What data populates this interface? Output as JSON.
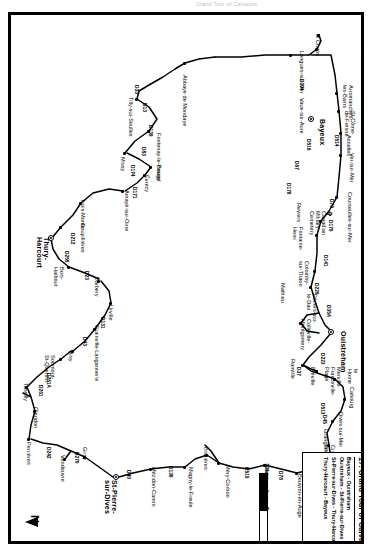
{
  "header": {
    "faint_text": "Grand Tour of Calvados"
  },
  "copyright": {
    "mark": "© IGN/CRT"
  },
  "legend": {
    "title": "17. Grand Tour of Calvados",
    "stages": [
      "Bayeux - Ouistreham",
      "Ouistreham - St-Pierre-sur-Dives",
      "St-Pierre-sur-Dives - Thury-Harcourt",
      "Thury-Harcourt - Bayeux"
    ]
  },
  "scale": {
    "ticks": [
      "0",
      "5",
      "10km"
    ],
    "unit": "km"
  },
  "compass": {
    "label": "N"
  },
  "chart_data": {
    "type": "map",
    "title": "17. Grand Tour of Calvados",
    "region": "Calvados, Normandy, France",
    "orientation": "north-to-left (page rotated 90°)",
    "major_towns": [
      "Bayeux",
      "Ouistreham",
      "St-Pierre-sur-Dives",
      "Thury-Harcourt"
    ],
    "places": [
      "le Chaos",
      "Longues-sur-Mer",
      "Vaux-sur-Aure",
      "Bayeux",
      "Arromanches-les-Bains",
      "St-Côme-de-Fresné",
      "Asnelles",
      "Ver-sur-Mer",
      "Courseulles-sur-Mer",
      "Canadian Military Cemetery",
      "Reviers",
      "Fontaine-Henri",
      "Colomby-sur-Thaon",
      "Périers-sur-le-Dan",
      "Mathieu",
      "Colleville-Montgomery",
      "Ouistreham",
      "Ranville",
      "Bréville",
      "Merville-Franceville-Plage",
      "Cabourg",
      "le Home",
      "Dives-sur-Mer",
      "Grangues",
      "Cricqueville-en-Auge",
      "Putot-en-Auge",
      "Beuvron-en-Auge",
      "Hotot-en-Auge",
      "Méry-Corbon",
      "Bissières",
      "Magny-le-Freule",
      "Mézidon-Canon",
      "St-Pierre-sur-Dives",
      "Grisy",
      "Vendeuvre",
      "Perrières",
      "Olendon",
      "Tassilly",
      "Soumont-St-Quentin",
      "Aisy",
      "Grainville-Langannerie",
      "Urville",
      "Barbery",
      "Bois-Halbout",
      "Thury-Harcourt",
      "Goupillières",
      "Trois-Monts",
      "Amayé-sur-Orne",
      "Évrecy",
      "Bougy",
      "Missy",
      "Fontenay-le-Pesnel",
      "Tilly-sur-Seulles",
      "Abbaye de Mondaye"
    ],
    "roads": [
      "D104",
      "D516",
      "D67",
      "D178",
      "D514",
      "D79",
      "D170",
      "D141",
      "D220",
      "D35A",
      "D223",
      "D37",
      "D27",
      "D513",
      "D45",
      "D49",
      "D78",
      "D510",
      "D138",
      "D40",
      "D270",
      "D242",
      "D261",
      "D261A",
      "D131",
      "D43",
      "D23",
      "D255",
      "D212",
      "D171",
      "D174",
      "D83",
      "D139",
      "D13",
      "D33"
    ]
  },
  "map": {
    "labels": [
      {
        "t": "le Chaos",
        "x": 19,
        "y": 41,
        "c": "lbl"
      },
      {
        "t": "Longues-sur-Mer",
        "x": 36,
        "y": 57,
        "c": "lbl"
      },
      {
        "t": "Vaux-sur-Aure",
        "x": 83,
        "y": 57,
        "c": "lbl"
      },
      {
        "t": "Bayeux",
        "x": 104,
        "y": 36,
        "c": "lbl big"
      },
      {
        "t": "Arromanches-\nles-Bains",
        "x": 70,
        "y": 8,
        "c": "lbl"
      },
      {
        "t": "St-Côme-\nde-Fresné",
        "x": 96,
        "y": 6,
        "c": "lbl"
      },
      {
        "t": "Asnelles",
        "x": 120,
        "y": 10,
        "c": "lbl"
      },
      {
        "t": "Ver-sur-Mer",
        "x": 138,
        "y": 7,
        "c": "lbl"
      },
      {
        "t": "Courseulles-sur-Mer",
        "x": 177,
        "y": 9,
        "c": "lbl"
      },
      {
        "t": "Canadian\nMilitary\nCemetery",
        "x": 196,
        "y": 35,
        "c": "lbl"
      },
      {
        "t": "Reviers",
        "x": 188,
        "y": 60,
        "c": "lbl"
      },
      {
        "t": "Fontaine-\nHenri",
        "x": 212,
        "y": 58,
        "c": "lbl"
      },
      {
        "t": "Colomby-\nsur-Thaon",
        "x": 246,
        "y": 52,
        "c": "lbl"
      },
      {
        "t": "Périers-sur-\nle-Dan",
        "x": 279,
        "y": 44,
        "c": "lbl"
      },
      {
        "t": "Mathieu",
        "x": 268,
        "y": 76,
        "c": "lbl"
      },
      {
        "t": "Colleville-\nMontgomery",
        "x": 304,
        "y": 50,
        "c": "lbl"
      },
      {
        "t": "Ouistreham",
        "x": 316,
        "y": 15,
        "c": "lbl big"
      },
      {
        "t": "Ranville",
        "x": 344,
        "y": 66,
        "c": "lbl"
      },
      {
        "t": "Bréville",
        "x": 352,
        "y": 46,
        "c": "lbl"
      },
      {
        "t": "Merville-\nFranceville-\nPlage",
        "x": 352,
        "y": 20,
        "c": "lbl"
      },
      {
        "t": "Cabourg",
        "x": 372,
        "y": 7,
        "c": "lbl"
      },
      {
        "t": "le\nHome",
        "x": 354,
        "y": 3,
        "c": "lbl"
      },
      {
        "t": "Dives-sur-Mer",
        "x": 397,
        "y": 18,
        "c": "lbl"
      },
      {
        "t": "Grangues",
        "x": 414,
        "y": 33,
        "c": "lbl"
      },
      {
        "t": "Cricqueville-\nen-Auge",
        "x": 430,
        "y": 26,
        "c": "lbl"
      },
      {
        "t": "Putot-en-Auge",
        "x": 452,
        "y": 25,
        "c": "lbl"
      },
      {
        "t": "Beuvron-en-Auge",
        "x": 459,
        "y": 59,
        "c": "lbl"
      },
      {
        "t": "Hotot-en-Auge",
        "x": 451,
        "y": 92,
        "c": "lbl"
      },
      {
        "t": "Méry-Corbon",
        "x": 450,
        "y": 131,
        "c": "lbl"
      },
      {
        "t": "Bissières",
        "x": 432,
        "y": 153,
        "c": "lbl"
      },
      {
        "t": "Magny-le-Freule",
        "x": 452,
        "y": 168,
        "c": "lbl"
      },
      {
        "t": "Mézidon-Canon",
        "x": 452,
        "y": 205,
        "c": "lbl"
      },
      {
        "t": "St-Pierre-\nsur-Dives",
        "x": 465,
        "y": 244,
        "c": "lbl big"
      },
      {
        "t": "Grisy",
        "x": 432,
        "y": 274,
        "c": "lbl"
      },
      {
        "t": "Vendeuvre",
        "x": 440,
        "y": 296,
        "c": "lbl"
      },
      {
        "t": "Perrières",
        "x": 427,
        "y": 330,
        "c": "lbl"
      },
      {
        "t": "Olendon",
        "x": 392,
        "y": 323,
        "c": "lbl"
      },
      {
        "t": "Tassilly",
        "x": 368,
        "y": 333,
        "c": "lbl"
      },
      {
        "t": "Soumont-\nSt-Quentin",
        "x": 340,
        "y": 306,
        "c": "lbl"
      },
      {
        "t": "Aisy",
        "x": 336,
        "y": 288,
        "c": "lbl"
      },
      {
        "t": "Grainville-Langannerie",
        "x": 310,
        "y": 262,
        "c": "lbl"
      },
      {
        "t": "Urville",
        "x": 290,
        "y": 248,
        "c": "lbl"
      },
      {
        "t": "Barbery",
        "x": 262,
        "y": 262,
        "c": "lbl"
      },
      {
        "t": "Bois-\nHalbout",
        "x": 252,
        "y": 297,
        "c": "lbl"
      },
      {
        "t": "Thury-\nHarcourt",
        "x": 222,
        "y": 312,
        "c": "lbl big"
      },
      {
        "t": "Goupillières",
        "x": 208,
        "y": 276,
        "c": "lbl"
      },
      {
        "t": "Trois-Monts",
        "x": 184,
        "y": 276,
        "c": "lbl"
      },
      {
        "t": "Amayé-sur-Orne",
        "x": 175,
        "y": 232,
        "c": "lbl"
      },
      {
        "t": "Évrecy",
        "x": 160,
        "y": 212,
        "c": "lbl"
      },
      {
        "t": "Bougy",
        "x": 150,
        "y": 200,
        "c": "lbl"
      },
      {
        "t": "Missy",
        "x": 142,
        "y": 236,
        "c": "lbl"
      },
      {
        "t": "Fontenay-le-Pesnel",
        "x": 118,
        "y": 200,
        "c": "lbl"
      },
      {
        "t": "Tilly-sur-Seulles",
        "x": 82,
        "y": 228,
        "c": "lbl"
      },
      {
        "t": "Abbaye de Mondaye",
        "x": 60,
        "y": 174,
        "c": "lbl"
      }
    ],
    "roads": [
      {
        "t": "D104",
        "x": 64,
        "y": 57
      },
      {
        "t": "D516",
        "x": 124,
        "y": 50
      },
      {
        "t": "D67",
        "x": 146,
        "y": 62
      },
      {
        "t": "D178",
        "x": 168,
        "y": 70
      },
      {
        "t": "D514",
        "x": 120,
        "y": 22
      },
      {
        "t": "D79",
        "x": 184,
        "y": 27
      },
      {
        "t": "D170",
        "x": 205,
        "y": 28
      },
      {
        "t": "D141",
        "x": 240,
        "y": 33
      },
      {
        "t": "D220",
        "x": 268,
        "y": 42
      },
      {
        "t": "D35A",
        "x": 290,
        "y": 30
      },
      {
        "t": "D223",
        "x": 338,
        "y": 36
      },
      {
        "t": "D37",
        "x": 352,
        "y": 60
      },
      {
        "t": "D513",
        "x": 388,
        "y": 36
      },
      {
        "t": "D45",
        "x": 400,
        "y": 34
      },
      {
        "t": "D49",
        "x": 447,
        "y": 44
      },
      {
        "t": "D78",
        "x": 456,
        "y": 78
      },
      {
        "t": "D510",
        "x": 452,
        "y": 112
      },
      {
        "t": "D138",
        "x": 451,
        "y": 188
      },
      {
        "t": "D40",
        "x": 455,
        "y": 230
      },
      {
        "t": "D270",
        "x": 437,
        "y": 282
      },
      {
        "t": "D242",
        "x": 432,
        "y": 310
      },
      {
        "t": "D261",
        "x": 370,
        "y": 318
      },
      {
        "t": "D261A",
        "x": 358,
        "y": 310
      },
      {
        "t": "D131",
        "x": 302,
        "y": 256
      },
      {
        "t": "D43",
        "x": 322,
        "y": 274
      },
      {
        "t": "D23",
        "x": 256,
        "y": 272
      },
      {
        "t": "D255",
        "x": 236,
        "y": 292
      },
      {
        "t": "D212",
        "x": 218,
        "y": 286
      },
      {
        "t": "D171",
        "x": 172,
        "y": 224
      },
      {
        "t": "D174",
        "x": 150,
        "y": 226
      },
      {
        "t": "D83",
        "x": 132,
        "y": 215
      },
      {
        "t": "D139",
        "x": 110,
        "y": 208
      },
      {
        "t": "D13",
        "x": 88,
        "y": 214
      },
      {
        "t": "D33",
        "x": 70,
        "y": 222
      }
    ]
  }
}
